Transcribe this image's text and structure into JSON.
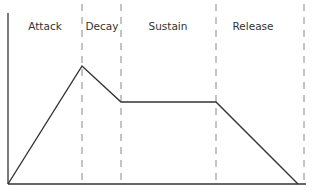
{
  "diagram": {
    "colors": {
      "background": "#ffffff",
      "line": "#333333",
      "axis": "#333333",
      "divider": "#888888",
      "text": "#333333"
    },
    "phases": [
      {
        "label": "Attack",
        "x": 45
      },
      {
        "label": "Decay",
        "x": 102
      },
      {
        "label": "Sustain",
        "x": 168
      },
      {
        "label": "Release",
        "x": 253
      }
    ],
    "label_y": 30,
    "dividers_x": [
      82,
      121,
      216,
      304
    ],
    "axes": {
      "origin": [
        8,
        184
      ],
      "y_top": 13,
      "x_right": 306
    },
    "envelope_points": [
      [
        8,
        184
      ],
      [
        82,
        66
      ],
      [
        121,
        102
      ],
      [
        216,
        102
      ],
      [
        298,
        184
      ]
    ]
  }
}
